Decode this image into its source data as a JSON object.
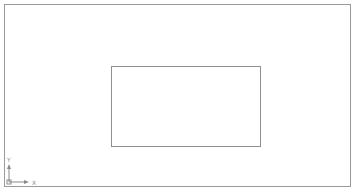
{
  "drawing": {
    "viewport": {
      "border_color": "#9a9a9a"
    },
    "rectangle": {
      "stroke_color": "#8f8f8f"
    },
    "ucs_icon": {
      "x_label": "X",
      "y_label": "Y",
      "color": "#8a8a8a"
    }
  }
}
